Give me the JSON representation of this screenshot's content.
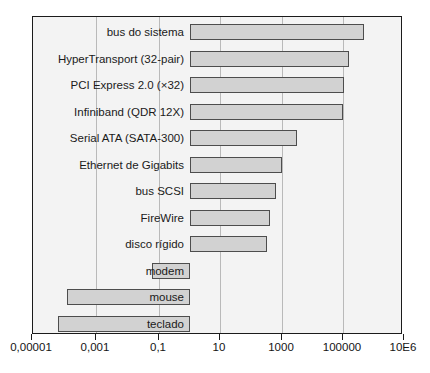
{
  "chart_data": {
    "type": "bar",
    "orientation": "horizontal",
    "title": "",
    "subtitle": "",
    "xlabel": "",
    "ylabel": "",
    "xscale": "log",
    "xlim": [
      1e-05,
      10000000
    ],
    "grid": true,
    "legend": null,
    "baseline_value": 1,
    "tick_labels": [
      "0,00001",
      "0,001",
      "0,1",
      "10",
      "1000",
      "100000",
      "10E6"
    ],
    "tick_values": [
      1e-05,
      0.001,
      0.1,
      10,
      1000,
      100000,
      1000000
    ],
    "categories": [
      "bus do sistema",
      "HyperTransport (32-pair)",
      "PCI Express 2.0 (×32)",
      "Infiniband (QDR 12X)",
      "Serial ATA (SATA-300)",
      "Ethernet de Gigabits",
      "bus SCSI",
      "FireWire",
      "disco rígido",
      "modem",
      "mouse",
      "teclado"
    ],
    "values": [
      280000,
      51000,
      16000,
      14000,
      300,
      100,
      60,
      40,
      35,
      0.007,
      0.0001,
      5e-05
    ]
  },
  "bars": [
    {
      "label": "bus do sistema",
      "value": 280000,
      "start_px": 189,
      "end_px": 363,
      "label_inside": false
    },
    {
      "label": "HyperTransport (32-pair)",
      "value": 51000,
      "start_px": 189,
      "end_px": 348,
      "label_inside": false
    },
    {
      "label": "PCI Express 2.0 (×32)",
      "value": 16000,
      "start_px": 189,
      "end_px": 343,
      "label_inside": false
    },
    {
      "label": "Infiniband (QDR 12X)",
      "value": 14000,
      "start_px": 189,
      "end_px": 342,
      "label_inside": false
    },
    {
      "label": "Serial ATA (SATA-300)",
      "value": 300,
      "start_px": 189,
      "end_px": 296,
      "label_inside": false
    },
    {
      "label": "Ethernet de Gigabits",
      "value": 100,
      "start_px": 189,
      "end_px": 281,
      "label_inside": false
    },
    {
      "label": "bus SCSI",
      "value": 60,
      "start_px": 189,
      "end_px": 275,
      "label_inside": false
    },
    {
      "label": "FireWire",
      "value": 40,
      "start_px": 189,
      "end_px": 269,
      "label_inside": false
    },
    {
      "label": "disco rígido",
      "value": 35,
      "start_px": 189,
      "end_px": 266,
      "label_inside": false
    },
    {
      "label": "modem",
      "value": 0.007,
      "start_px": 151,
      "end_px": 189,
      "label_inside": true
    },
    {
      "label": "mouse",
      "value": 0.0001,
      "start_px": 66,
      "end_px": 189,
      "label_inside": true
    },
    {
      "label": "teclado",
      "value": 5e-05,
      "start_px": 57,
      "end_px": 189,
      "label_inside": true
    }
  ],
  "axis": {
    "ticks": [
      {
        "label": "0,00001",
        "x_px": 31
      },
      {
        "label": "0,001",
        "x_px": 95
      },
      {
        "label": "0,1",
        "x_px": 158
      },
      {
        "label": "10",
        "x_px": 219
      },
      {
        "label": "1000",
        "x_px": 281
      },
      {
        "label": "100000",
        "x_px": 342
      },
      {
        "label": "10E6",
        "x_px": 403
      }
    ]
  },
  "colors": {
    "bar_fill": "#d2d2d2",
    "bar_stroke": "#4d4d4d",
    "frame": "#1b1b1b",
    "grid": "#b9b9b9",
    "plot_bg": "#f3f3f3",
    "text": "#1a1a1a",
    "page_bg": "#ffffff"
  }
}
